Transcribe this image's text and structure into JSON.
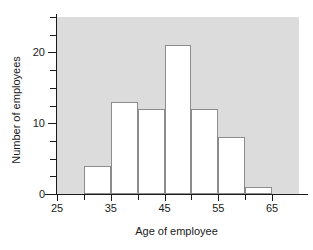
{
  "chart_data": {
    "type": "bar",
    "title": "",
    "subtitle": "",
    "xlabel": "Age of employee",
    "ylabel": "Number of employees",
    "categories": [
      "30-35",
      "35-40",
      "40-45",
      "45-50",
      "50-55",
      "55-60",
      "60-65"
    ],
    "bin_edges": [
      30,
      35,
      40,
      45,
      50,
      55,
      60,
      65
    ],
    "bin_width": 5,
    "values": [
      4,
      13,
      12,
      21,
      12,
      8,
      1
    ],
    "xlim": [
      25,
      70
    ],
    "ylim": [
      0,
      25
    ],
    "x_tick_labels": [
      "25",
      "35",
      "45",
      "55",
      "65"
    ],
    "x_major_ticks": [
      25,
      35,
      45,
      55,
      65
    ],
    "x_minor_ticks": [
      30,
      40,
      50,
      60
    ],
    "y_tick_labels": [
      "0",
      "10",
      "20"
    ],
    "y_major_ticks": [
      0,
      10,
      20
    ],
    "y_minor_ticks": [
      2.5,
      5,
      7.5,
      12.5,
      15,
      17.5,
      22.5,
      25
    ],
    "grid": false,
    "legend": null,
    "legend_position": "none",
    "colors": {
      "plot_background": "#dcdcdc",
      "bar_fill": "#ffffff",
      "bar_edge": "#8c8c8c",
      "axis": "#1a1a1a",
      "text": "#1a1a1a",
      "figure_background": "#ffffff"
    },
    "annotations": []
  },
  "axes": {
    "y_title": "Number of employees",
    "x_title": "Age of employee"
  },
  "y_labels": [
    {
      "text": "0",
      "value": 0
    },
    {
      "text": "10",
      "value": 10
    },
    {
      "text": "20",
      "value": 20
    }
  ],
  "x_labels": [
    {
      "text": "25",
      "value": 25
    },
    {
      "text": "35",
      "value": 35
    },
    {
      "text": "45",
      "value": 45
    },
    {
      "text": "55",
      "value": 55
    },
    {
      "text": "65",
      "value": 65
    }
  ]
}
